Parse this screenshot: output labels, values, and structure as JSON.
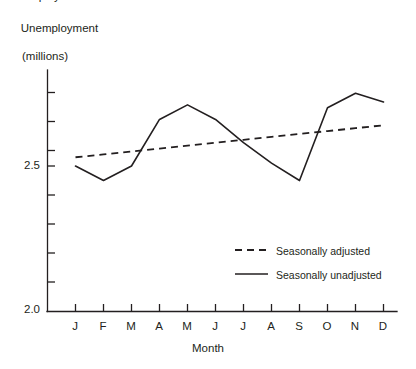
{
  "chart_data": {
    "type": "line",
    "title": "",
    "ylabel": "Unemployment\n(millions)",
    "ylabel_line1": "Unemployment",
    "ylabel_line2": "(millions)",
    "xlabel": "Month",
    "categories": [
      "J",
      "F",
      "M",
      "A",
      "M",
      "J",
      "J",
      "A",
      "S",
      "O",
      "N",
      "D"
    ],
    "category_names": [
      "January",
      "February",
      "March",
      "April",
      "May",
      "June",
      "July",
      "August",
      "September",
      "October",
      "November",
      "December"
    ],
    "ylim": [
      2.0,
      2.8
    ],
    "ytick_labels": [
      "2.0",
      "2.5"
    ],
    "ytick_values": [
      2.0,
      2.5
    ],
    "grid": false,
    "legend_position": "inside-lower-right",
    "series": [
      {
        "name": "Seasonally adjusted",
        "style": "dashed",
        "color": "#231f20",
        "values": [
          2.53,
          2.54,
          2.55,
          2.56,
          2.57,
          2.58,
          2.59,
          2.6,
          2.61,
          2.62,
          2.63,
          2.64
        ]
      },
      {
        "name": "Seasonally unadjusted",
        "style": "solid",
        "color": "#231f20",
        "values": [
          2.5,
          2.45,
          2.5,
          2.66,
          2.71,
          2.66,
          2.58,
          2.51,
          2.45,
          2.7,
          2.75,
          2.72
        ]
      }
    ],
    "series_unadjusted_note": "December value 2.55"
  },
  "legend": {
    "items": [
      {
        "label": "Seasonally adjusted",
        "style": "dashed"
      },
      {
        "label": "Seasonally unadjusted",
        "style": "solid"
      }
    ]
  },
  "axes": {
    "y_title_line1": "Unemployment",
    "y_title_line2": "(millions)",
    "x_title": "Month",
    "y_labels": [
      "2.5",
      "2.0"
    ],
    "x_labels": [
      "J",
      "F",
      "M",
      "A",
      "M",
      "J",
      "J",
      "A",
      "S",
      "O",
      "N",
      "D"
    ]
  },
  "colors": {
    "ink": "#231f20",
    "background": "#ffffff"
  }
}
